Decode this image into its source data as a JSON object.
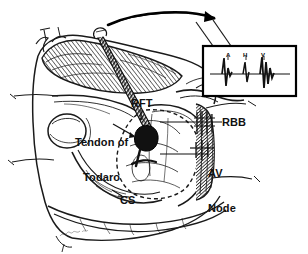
{
  "figure": {
    "kind": "anatomical-line-drawing",
    "background_color": "#ffffff",
    "ink_color": "#111111",
    "width": 308,
    "height": 254
  },
  "labels": {
    "rft": "RFT",
    "tendon_of_todaro_line1": "Tendon of",
    "tendon_of_todaro_line2": "Todaro",
    "rbb": "RBB",
    "av_node_line1": "AV",
    "av_node_line2": "Node",
    "cs": "CS"
  },
  "inset": {
    "name": "intracardiac-electrogram",
    "border_color": "#000000",
    "deflections": [
      {
        "key": "a",
        "label": "A",
        "meaning": "atrial"
      },
      {
        "key": "h",
        "label": "H",
        "meaning": "His"
      },
      {
        "key": "v",
        "label": "V",
        "meaning": "ventricular"
      }
    ]
  },
  "annotations": {
    "signature": "artist-signature",
    "top_arrow": "curved-arrow-to-inset"
  }
}
